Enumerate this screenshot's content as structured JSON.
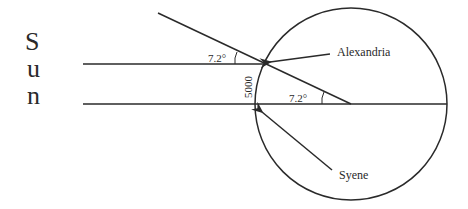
{
  "diagram": {
    "title_vertical": [
      "S",
      "u",
      "n"
    ],
    "labels": {
      "alexandria": "Alexandria",
      "syene": "Syene",
      "distance": "5000",
      "angle_top": "7.2°",
      "angle_center": "7.2°"
    },
    "colors": {
      "stroke": "#2a2a2a",
      "background": "#ffffff"
    }
  }
}
